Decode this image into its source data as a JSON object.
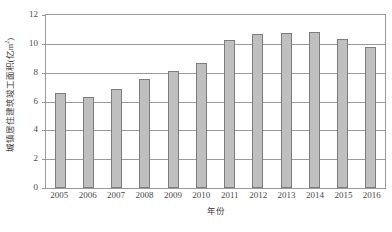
{
  "chart_data": {
    "type": "bar",
    "title": "",
    "xlabel": "年份",
    "ylabel": "城镇居住建筑竣工面积(亿m²)",
    "ylabel_main": "城镇居住建筑竣工面积(亿m",
    "ylabel_sup": "2",
    "ylabel_tail": ")",
    "categories": [
      "2005",
      "2006",
      "2007",
      "2008",
      "2009",
      "2010",
      "2011",
      "2012",
      "2013",
      "2014",
      "2015",
      "2016"
    ],
    "values": [
      6.6,
      6.3,
      6.85,
      7.55,
      8.1,
      8.7,
      10.25,
      10.65,
      10.75,
      10.85,
      10.35,
      9.8
    ],
    "yticks": [
      0,
      2,
      4,
      6,
      8,
      10,
      12
    ],
    "ylim": [
      0,
      12
    ],
    "grid": true,
    "legend": "none",
    "bar_color": "#bfbfbf",
    "bar_border_color": "#7d7d7d",
    "axis_color": "#9a9a9a"
  }
}
